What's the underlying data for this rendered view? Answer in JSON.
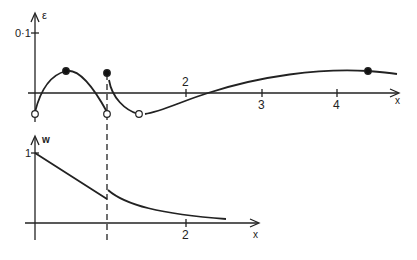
{
  "figure": {
    "top_plot": {
      "y_label": "ε",
      "x_label": "x",
      "y_tick_label": "0·1",
      "x_tick_labels": [
        "2",
        "3",
        "4"
      ],
      "curve": "epsilon(x) with discontinuity at x=1",
      "markers": {
        "filled": [
          {
            "x": 0.4,
            "desc": "local max"
          },
          {
            "x": 1.0,
            "desc": "jump start"
          },
          {
            "x": 4.4,
            "desc": "max"
          }
        ],
        "hollow": [
          {
            "x": 0.0
          },
          {
            "x": 1.0
          },
          {
            "x": 1.4
          }
        ]
      }
    },
    "bottom_plot": {
      "y_label": "w",
      "x_label": "x",
      "y_tick_label": "1",
      "x_tick_labels": [
        "1",
        "2"
      ],
      "curve": "w(x) decreasing linearly to x=1, jumps up, then decays"
    },
    "divider": "dashed vertical line at x=1"
  }
}
